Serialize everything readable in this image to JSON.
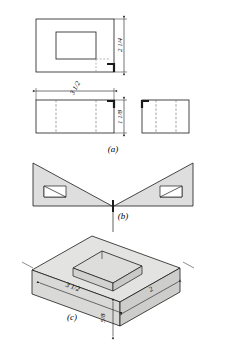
{
  "figure": {
    "background_color": "#ffffff",
    "line_color": "#1a1a1a",
    "hidden_line_color": "#4a4a4a",
    "face_fill_light": "#e2e2e0",
    "face_fill_mid": "#d8d8d6",
    "face_fill_dark": "#cfcfcd"
  },
  "part_labels": {
    "a": "(a)",
    "b": "(b)",
    "c": "(c)"
  },
  "views": {
    "top_view": {
      "name": "top-view",
      "outer_label": "outer rectangle",
      "inner_label": "recess opening"
    },
    "front_view": {
      "name": "front-view"
    },
    "side_view": {
      "name": "side-view"
    },
    "development_view": {
      "name": "development-view",
      "left_wedge": "left-wedge",
      "right_wedge": "right-wedge"
    },
    "isometric_view": {
      "name": "isometric-view"
    }
  },
  "dimensions": {
    "top_height": {
      "label_whole": "2",
      "label_num": "1",
      "label_den": "4",
      "text": "2 1/4"
    },
    "front_width": {
      "label_whole": "3",
      "label_num": "1",
      "label_den": "2",
      "text": "3 1/2"
    },
    "front_height": {
      "label_whole": "1",
      "label_num": "1",
      "label_den": "8",
      "text": "1 1/8"
    },
    "iso_length": {
      "label_whole": "3",
      "label_num": "1",
      "label_den": "2",
      "text": "3 1/2"
    },
    "iso_depth": {
      "label_whole": "2",
      "label_num": "",
      "label_den": "",
      "text": "2"
    },
    "iso_height": {
      "label_whole": "",
      "label_num": "5",
      "label_den": "8",
      "text": "5/8"
    }
  }
}
